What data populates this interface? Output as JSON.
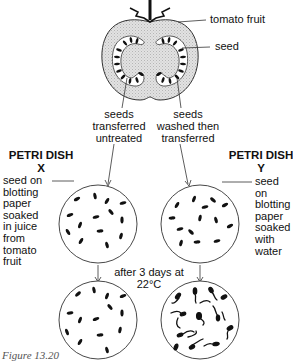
{
  "figure": {
    "caption": "Figure 13.20",
    "labels": {
      "tomato_fruit": "tomato fruit",
      "seed": "seed"
    },
    "transfer": {
      "left": [
        "seeds",
        "transferred",
        "untreated"
      ],
      "right": [
        "seeds",
        "washed then",
        "transferred"
      ]
    },
    "dish_x": {
      "title": "PETRI DISH",
      "letter": "X",
      "description": [
        "seed on",
        "blotting",
        "paper",
        "soaked",
        "in juice",
        "from",
        "tomato",
        "fruit"
      ]
    },
    "dish_y": {
      "title": "PETRI DISH",
      "letter": "Y",
      "description": [
        "seed on",
        "blotting",
        "paper",
        "soaked",
        "with",
        "water"
      ]
    },
    "condition": [
      "after 3 days at",
      "22°C"
    ],
    "result": {
      "dish_x": "seeds not germinated",
      "dish_y": "seeds germinated"
    }
  }
}
